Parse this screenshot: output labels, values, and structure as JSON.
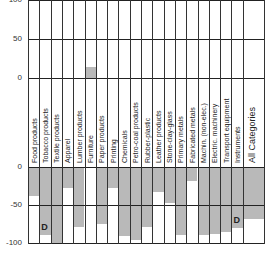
{
  "chart_data": [
    {
      "type": "bar",
      "title": "",
      "xlabel": "",
      "ylabel": "",
      "ylim": [
        0,
        100
      ],
      "yticks": [
        0,
        50,
        100
      ],
      "grid": true,
      "categories": [
        "Food products",
        "Tobacco products",
        "Textile products",
        "Apparel",
        "Lumber products",
        "Furniture",
        "Paper products",
        "Printing",
        "Chemicals",
        "Petro-coal products",
        "Rubber-plastic",
        "Leather products",
        "Stone-clay-glass",
        "Primary metals",
        "Fabricated metals",
        "Machin. (non-elec.)",
        "Electric. machinery",
        "Transport equipment",
        "Instruments",
        "All Categories"
      ],
      "values": [
        0,
        0,
        0,
        0,
        0,
        14,
        0,
        0,
        0,
        0,
        0,
        0,
        0,
        0,
        0,
        0,
        0,
        0,
        0,
        0
      ]
    },
    {
      "type": "bar",
      "title": "",
      "xlabel": "",
      "ylabel": "",
      "ylim": [
        -100,
        0
      ],
      "yticks": [
        0,
        -50,
        -100
      ],
      "grid": true,
      "categories": [
        "Food products",
        "Tobacco products",
        "Textile products",
        "Apparel",
        "Lumber products",
        "Furniture",
        "Paper products",
        "Printing",
        "Chemicals",
        "Petro-coal products",
        "Rubber-plastic",
        "Leather products",
        "Stone-clay-glass",
        "Primary metals",
        "Fabricated metals",
        "Machin. (non-elec.)",
        "Electric. machinery",
        "Transport equipment",
        "Instruments",
        "All Categories"
      ],
      "values": [
        -38,
        -89,
        -100,
        -27,
        -79,
        0,
        -75,
        -27,
        -91,
        -96,
        -79,
        -33,
        -47,
        -89,
        -18,
        -90,
        -88,
        -86,
        -80,
        -68
      ],
      "annotations": [
        {
          "category": "Tobacco products",
          "text": "D"
        },
        {
          "category": "Instruments",
          "text": "D"
        }
      ]
    }
  ],
  "axis": {
    "top_ticks": [
      "100",
      "50",
      "0"
    ],
    "bottom_ticks": [
      "0",
      "-50",
      "-100"
    ]
  },
  "annotation_text": "D",
  "colors": {
    "bar": "#b9b9b9",
    "grid": "#222222",
    "background": "#ffffff"
  }
}
